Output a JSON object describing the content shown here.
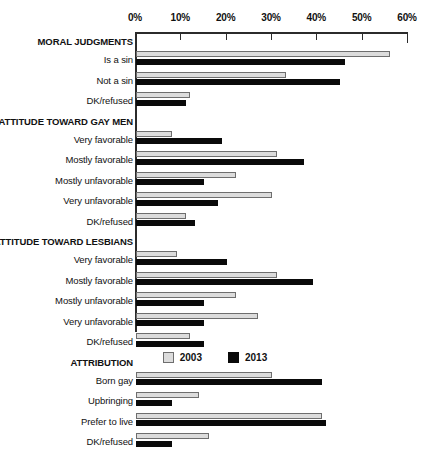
{
  "chart_data": {
    "type": "bar",
    "orientation": "horizontal",
    "title": "",
    "xlabel": "",
    "ylabel": "",
    "xlim": [
      0,
      60
    ],
    "xticks": [
      0,
      10,
      20,
      30,
      40,
      50,
      60
    ],
    "xticklabels": [
      "0%",
      "10%",
      "20%",
      "30%",
      "40%",
      "50%",
      "60%"
    ],
    "grid": false,
    "legend_position": "bottom-center",
    "series": [
      {
        "name": "2003",
        "color": "#dcdcdc"
      },
      {
        "name": "2013",
        "color": "#0a0a0a"
      }
    ],
    "groups": [
      {
        "label": "MORAL JUDGMENTS",
        "rows": [
          {
            "label": "Is a sin",
            "values": [
              56,
              46
            ]
          },
          {
            "label": "Not a sin",
            "values": [
              33,
              45
            ]
          },
          {
            "label": "DK/refused",
            "values": [
              12,
              11
            ]
          }
        ]
      },
      {
        "label": "ATTITUDE TOWARD GAY MEN",
        "rows": [
          {
            "label": "Very favorable",
            "values": [
              8,
              19
            ]
          },
          {
            "label": "Mostly favorable",
            "values": [
              31,
              37
            ]
          },
          {
            "label": "Mostly unfavorable",
            "values": [
              22,
              15
            ]
          },
          {
            "label": "Very unfavorable",
            "values": [
              30,
              18
            ]
          },
          {
            "label": "DK/refused",
            "values": [
              11,
              13
            ]
          }
        ]
      },
      {
        "label": "ATTITUDE TOWARD LESBIANS",
        "rows": [
          {
            "label": "Very favorable",
            "values": [
              9,
              20
            ]
          },
          {
            "label": "Mostly favorable",
            "values": [
              31,
              39
            ]
          },
          {
            "label": "Mostly unfavorable",
            "values": [
              22,
              15
            ]
          },
          {
            "label": "Very unfavorable",
            "values": [
              27,
              15
            ]
          },
          {
            "label": "DK/refused",
            "values": [
              12,
              15
            ]
          }
        ]
      },
      {
        "label": "ATTRIBUTION",
        "rows": [
          {
            "label": "Born gay",
            "values": [
              30,
              41
            ]
          },
          {
            "label": "Upbringing",
            "values": [
              14,
              8
            ]
          },
          {
            "label": "Prefer to live",
            "values": [
              41,
              42
            ]
          },
          {
            "label": "DK/refused",
            "values": [
              16,
              8
            ]
          }
        ]
      }
    ]
  },
  "legend": {
    "items": [
      {
        "label": "2003"
      },
      {
        "label": "2013"
      }
    ]
  }
}
